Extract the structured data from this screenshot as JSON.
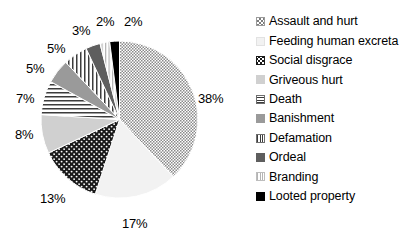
{
  "chart_data": {
    "type": "pie",
    "title": "",
    "xlabel": "",
    "ylabel": "",
    "legend_position": "right",
    "grid": false,
    "start_angle_deg": 0,
    "direction": "clockwise",
    "categories": [
      "Assault and hurt",
      "Feeding human excreta",
      "Social disgrace",
      "Griveous hurt",
      "Death",
      "Banishment",
      "Defamation",
      "Ordeal",
      "Branding",
      "Looted property"
    ],
    "values": [
      38,
      17,
      13,
      8,
      7,
      5,
      5,
      3,
      2,
      2
    ],
    "data_labels": [
      "38%",
      "17%",
      "13%",
      "8%",
      "7%",
      "5%",
      "5%",
      "3%",
      "2%",
      "2%"
    ],
    "slices": [
      {
        "label": "Assault and hurt",
        "value": 38,
        "data_label": "38%",
        "pattern": "checkerboard",
        "fill": "#d9d9d9",
        "ink": "#4a4a4a"
      },
      {
        "label": "Feeding human excreta",
        "value": 17,
        "data_label": "17%",
        "pattern": "solid",
        "fill": "#f2f2f2",
        "ink": "#f2f2f2"
      },
      {
        "label": "Social disgrace",
        "value": 13,
        "data_label": "13%",
        "pattern": "dots-white-on-black",
        "fill": "#1a1a1a",
        "ink": "#ffffff"
      },
      {
        "label": "Griveous hurt",
        "value": 8,
        "data_label": "8%",
        "pattern": "solid",
        "fill": "#d0d0d0",
        "ink": "#d0d0d0"
      },
      {
        "label": "Death",
        "value": 7,
        "data_label": "7%",
        "pattern": "horizontal-lines",
        "fill": "#ffffff",
        "ink": "#3c3c3c"
      },
      {
        "label": "Banishment",
        "value": 5,
        "data_label": "5%",
        "pattern": "solid",
        "fill": "#9a9a9a",
        "ink": "#9a9a9a"
      },
      {
        "label": "Defamation",
        "value": 5,
        "data_label": "5%",
        "pattern": "vertical-lines",
        "fill": "#ffffff",
        "ink": "#3c3c3c"
      },
      {
        "label": "Ordeal",
        "value": 3,
        "data_label": "3%",
        "pattern": "solid",
        "fill": "#5e5e5e",
        "ink": "#5e5e5e"
      },
      {
        "label": "Branding",
        "value": 2,
        "data_label": "2%",
        "pattern": "vertical-lines-light",
        "fill": "#ffffff",
        "ink": "#b4b4b4"
      },
      {
        "label": "Looted property",
        "value": 2,
        "data_label": "2%",
        "pattern": "solid",
        "fill": "#000000",
        "ink": "#000000"
      }
    ]
  },
  "legend": {
    "items": [
      {
        "label": "Assault and hurt"
      },
      {
        "label": "Feeding human excreta"
      },
      {
        "label": "Social disgrace"
      },
      {
        "label": "Griveous hurt"
      },
      {
        "label": "Death"
      },
      {
        "label": "Banishment"
      },
      {
        "label": "Defamation"
      },
      {
        "label": "Ordeal"
      },
      {
        "label": "Branding"
      },
      {
        "label": "Looted property"
      }
    ]
  },
  "labels": {
    "p38": "38%",
    "p17": "17%",
    "p13": "13%",
    "p8": "8%",
    "p7": "7%",
    "p5a": "5%",
    "p5b": "5%",
    "p3": "3%",
    "p2a": "2%",
    "p2b": "2%"
  },
  "colors": {
    "background": "#ffffff",
    "text": "#000000",
    "slice_outline": "#ffffff"
  }
}
